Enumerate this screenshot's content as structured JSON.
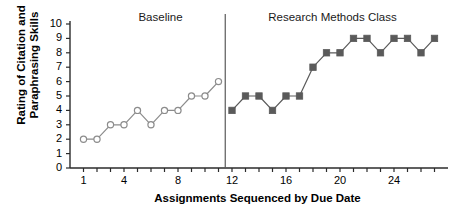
{
  "chart_data": {
    "type": "line",
    "title": "",
    "xlabel": "Assignments Sequenced by Due Date",
    "ylabel": "Rating of Citation and Paraphrasing Skills",
    "ylabel_line1": "Rating of Citation and",
    "ylabel_line2": "Paraphrasing Skills",
    "xlim": [
      0,
      28
    ],
    "ylim": [
      0,
      10
    ],
    "grid": false,
    "legend_position": "none",
    "y_ticks": [
      0,
      1,
      2,
      3,
      4,
      5,
      6,
      7,
      8,
      9,
      10
    ],
    "y_tick_labels": [
      "0",
      "1",
      "2",
      "3",
      "4",
      "5",
      "6",
      "7",
      "8",
      "9",
      "10"
    ],
    "x_ticks": [
      1,
      2,
      3,
      4,
      5,
      6,
      7,
      8,
      9,
      10,
      11,
      12,
      13,
      14,
      15,
      16,
      17,
      18,
      19,
      20,
      21,
      22,
      23,
      24,
      25,
      26,
      27
    ],
    "x_tick_labels": [
      "1",
      "",
      "",
      "4",
      "",
      "",
      "",
      "8",
      "",
      "",
      "",
      "12",
      "",
      "",
      "",
      "16",
      "",
      "",
      "",
      "20",
      "",
      "",
      "",
      "24",
      "",
      "",
      ""
    ],
    "phase_change_x": 11.5,
    "annotations": [
      {
        "name": "baseline",
        "text": "Baseline",
        "x": 6
      },
      {
        "name": "intervention",
        "text": "Research Methods Class",
        "x": 19.5
      }
    ],
    "series": [
      {
        "name": "Baseline",
        "marker": "open-circle",
        "color": "#8c8c8c",
        "fill": "#ffffff",
        "x": [
          1,
          2,
          3,
          4,
          5,
          6,
          7,
          8,
          9,
          10,
          11
        ],
        "values": [
          2,
          2,
          3,
          3,
          4,
          3,
          4,
          4,
          5,
          5,
          6
        ]
      },
      {
        "name": "Research Methods Class",
        "marker": "filled-square",
        "color": "#5a5a5a",
        "fill": "#5a5a5a",
        "x": [
          12,
          13,
          14,
          15,
          16,
          17,
          18,
          19,
          20,
          21,
          22,
          23,
          24,
          25,
          26,
          27
        ],
        "values": [
          4,
          5,
          5,
          4,
          5,
          5,
          7,
          8,
          8,
          9,
          9,
          8,
          9,
          9,
          8,
          9
        ]
      }
    ]
  },
  "colors": {
    "axis": "#2b2b2b",
    "baseline_marker": "#8c8c8c",
    "intervention_marker": "#5a5a5a",
    "text": "#000000"
  }
}
